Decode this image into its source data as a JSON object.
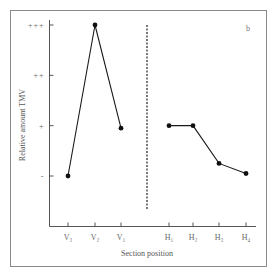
{
  "chart_data": {
    "type": "line",
    "panel_label": "b",
    "title": "",
    "xlabel": "Section position",
    "ylabel": "Relative amount TMV",
    "y_scale": {
      "levels": [
        "-",
        "+",
        "++",
        "+++"
      ],
      "ylim": [
        0,
        3
      ]
    },
    "y_ticks": [
      {
        "value": 0,
        "label": "-"
      },
      {
        "value": 1,
        "label": "+"
      },
      {
        "value": 2,
        "label": "++"
      },
      {
        "value": 3,
        "label": "+++"
      }
    ],
    "grid": false,
    "divider": "dashed vertical line separating V and H sections",
    "series": [
      {
        "name": "V sections",
        "categories": [
          "V3",
          "V2",
          "V1"
        ],
        "tick_labels": [
          "V₃",
          "V₂",
          "V₁"
        ],
        "values": [
          0,
          3,
          0.95
        ]
      },
      {
        "name": "H sections",
        "categories": [
          "H1",
          "H2",
          "H3",
          "H4"
        ],
        "tick_labels": [
          "H₁",
          "H₂",
          "H₃",
          "H₄"
        ],
        "values": [
          1,
          1,
          0.25,
          0.05
        ]
      }
    ]
  }
}
